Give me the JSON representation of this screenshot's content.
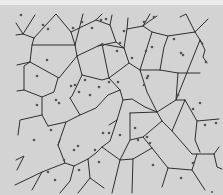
{
  "diagram": {
    "type": "voronoi",
    "background": "#d3d3d3",
    "edge_color": "#2e2e2e",
    "site_color": "#555555",
    "width": 223,
    "height": 195,
    "sites": [
      [
        21,
        15
      ],
      [
        43,
        25
      ],
      [
        48,
        29
      ],
      [
        47,
        60
      ],
      [
        37,
        76
      ],
      [
        82,
        22
      ],
      [
        73,
        28
      ],
      [
        101,
        20
      ],
      [
        92,
        28
      ],
      [
        106,
        19
      ],
      [
        124,
        31
      ],
      [
        144,
        22
      ],
      [
        154,
        17
      ],
      [
        152,
        47
      ],
      [
        174,
        39
      ],
      [
        181,
        53
      ],
      [
        181,
        55
      ],
      [
        206,
        62
      ],
      [
        120,
        43
      ],
      [
        103,
        45
      ],
      [
        117,
        51
      ],
      [
        132,
        58
      ],
      [
        146,
        51
      ],
      [
        147,
        78
      ],
      [
        37,
        105
      ],
      [
        56,
        100
      ],
      [
        59,
        103
      ],
      [
        79,
        92
      ],
      [
        71,
        86
      ],
      [
        75,
        85
      ],
      [
        85,
        80
      ],
      [
        90,
        95
      ],
      [
        99,
        87
      ],
      [
        109,
        82
      ],
      [
        118,
        82
      ],
      [
        144,
        85
      ],
      [
        148,
        76
      ],
      [
        178,
        95
      ],
      [
        193,
        109
      ],
      [
        200,
        103
      ],
      [
        205,
        125
      ],
      [
        216,
        123
      ],
      [
        34,
        140
      ],
      [
        51,
        130
      ],
      [
        48,
        172
      ],
      [
        64,
        160
      ],
      [
        74,
        150
      ],
      [
        78,
        146
      ],
      [
        79,
        170
      ],
      [
        55,
        180
      ],
      [
        99,
        162
      ],
      [
        95,
        150
      ],
      [
        103,
        133
      ],
      [
        109,
        133
      ],
      [
        120,
        135
      ],
      [
        135,
        128
      ],
      [
        138,
        140
      ],
      [
        147,
        137
      ],
      [
        150,
        143
      ],
      [
        153,
        165
      ],
      [
        181,
        178
      ],
      [
        193,
        163
      ],
      [
        212,
        192
      ]
    ],
    "edge_count_estimate": 140
  }
}
